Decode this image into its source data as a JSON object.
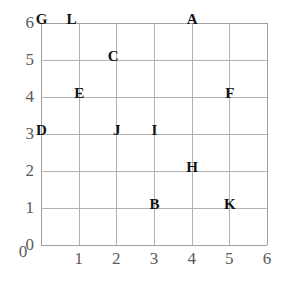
{
  "chart_data": {
    "type": "scatter",
    "title": "",
    "xlabel": "",
    "ylabel": "",
    "xlim": [
      0,
      6
    ],
    "ylim": [
      0,
      6
    ],
    "grid": true,
    "legend": "none",
    "x_ticks": [
      "0",
      "1",
      "2",
      "3",
      "4",
      "5",
      "6"
    ],
    "y_ticks": [
      "0",
      "1",
      "2",
      "3",
      "4",
      "5",
      "6"
    ],
    "x_tick_values": [
      0,
      1,
      2,
      3,
      4,
      5,
      6
    ],
    "y_tick_values": [
      0,
      1,
      2,
      3,
      4,
      5,
      6
    ],
    "point_style": "letter-label",
    "points": [
      {
        "label": "G",
        "x": 0,
        "y": 6
      },
      {
        "label": "L",
        "x": 0.8,
        "y": 6
      },
      {
        "label": "A",
        "x": 4,
        "y": 6
      },
      {
        "label": "C",
        "x": 1.9,
        "y": 5
      },
      {
        "label": "E",
        "x": 1,
        "y": 4
      },
      {
        "label": "F",
        "x": 5,
        "y": 4
      },
      {
        "label": "D",
        "x": 0,
        "y": 3
      },
      {
        "label": "J",
        "x": 2,
        "y": 3
      },
      {
        "label": "I",
        "x": 3,
        "y": 3
      },
      {
        "label": "H",
        "x": 4,
        "y": 2
      },
      {
        "label": "B",
        "x": 3,
        "y": 1
      },
      {
        "label": "K",
        "x": 5,
        "y": 1
      }
    ]
  },
  "colors": {
    "background": "#ffffff",
    "grid_line": "#b3b3b3",
    "axis_tick_text": "#5a5a5a",
    "point_label_text": "#111111"
  }
}
